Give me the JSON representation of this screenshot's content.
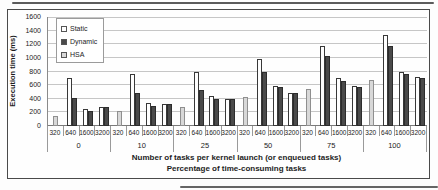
{
  "figure": {
    "y_axis_title": "Execution time (ms)",
    "caption_line1": "Number of tasks per kernel launch (or enqueued tasks)",
    "caption_line2": "Percentage of time-consuming tasks"
  },
  "chart_data": {
    "type": "bar",
    "title": "",
    "ylabel": "Execution time (ms)",
    "xlabel": "Number of tasks per kernel launch (or enqueued tasks)",
    "xlabel2": "Percentage of time-consuming tasks",
    "ylim": [
      0,
      1600
    ],
    "yticks": [
      0,
      200,
      400,
      600,
      800,
      1000,
      1200,
      1400,
      1600
    ],
    "grid": true,
    "legend_position": "upper-left-inside",
    "legend": [
      "Static",
      "Dynamic",
      "HSA"
    ],
    "series_colors": {
      "Static": "#fefefe",
      "Dynamic": "#4a4a4a",
      "HSA": "#d8d8d8"
    },
    "categories": [
      "0",
      "10",
      "25",
      "50",
      "75",
      "100"
    ],
    "slots": [
      "320",
      "640",
      "1600",
      "3200"
    ],
    "groups": [
      {
        "category": "0",
        "bars": [
          {
            "slot": "320",
            "series": "HSA",
            "value": 150
          },
          {
            "slot": "640",
            "series": "Static",
            "value": 700
          },
          {
            "slot": "640",
            "series": "Dynamic",
            "value": 410
          },
          {
            "slot": "1600",
            "series": "Static",
            "value": 250
          },
          {
            "slot": "1600",
            "series": "Dynamic",
            "value": 220
          },
          {
            "slot": "3200",
            "series": "Static",
            "value": 280
          },
          {
            "slot": "3200",
            "series": "Dynamic",
            "value": 280
          }
        ]
      },
      {
        "category": "10",
        "bars": [
          {
            "slot": "320",
            "series": "HSA",
            "value": 225
          },
          {
            "slot": "640",
            "series": "Static",
            "value": 760
          },
          {
            "slot": "640",
            "series": "Dynamic",
            "value": 490
          },
          {
            "slot": "1600",
            "series": "Static",
            "value": 340
          },
          {
            "slot": "1600",
            "series": "Dynamic",
            "value": 300
          },
          {
            "slot": "3200",
            "series": "Static",
            "value": 330
          },
          {
            "slot": "3200",
            "series": "Dynamic",
            "value": 330
          }
        ]
      },
      {
        "category": "25",
        "bars": [
          {
            "slot": "320",
            "series": "HSA",
            "value": 280
          },
          {
            "slot": "640",
            "series": "Static",
            "value": 800
          },
          {
            "slot": "640",
            "series": "Dynamic",
            "value": 530
          },
          {
            "slot": "1600",
            "series": "Static",
            "value": 440
          },
          {
            "slot": "1600",
            "series": "Dynamic",
            "value": 400
          },
          {
            "slot": "3200",
            "series": "Static",
            "value": 390
          },
          {
            "slot": "3200",
            "series": "Dynamic",
            "value": 390
          }
        ]
      },
      {
        "category": "50",
        "bars": [
          {
            "slot": "320",
            "series": "HSA",
            "value": 420
          },
          {
            "slot": "640",
            "series": "Static",
            "value": 990
          },
          {
            "slot": "640",
            "series": "Dynamic",
            "value": 790
          },
          {
            "slot": "1600",
            "series": "Static",
            "value": 590
          },
          {
            "slot": "1600",
            "series": "Dynamic",
            "value": 570
          },
          {
            "slot": "3200",
            "series": "Static",
            "value": 490
          },
          {
            "slot": "3200",
            "series": "Dynamic",
            "value": 490
          }
        ]
      },
      {
        "category": "75",
        "bars": [
          {
            "slot": "320",
            "series": "HSA",
            "value": 540
          },
          {
            "slot": "640",
            "series": "Static",
            "value": 1180
          },
          {
            "slot": "640",
            "series": "Dynamic",
            "value": 1030
          },
          {
            "slot": "1600",
            "series": "Static",
            "value": 700
          },
          {
            "slot": "1600",
            "series": "Dynamic",
            "value": 660
          },
          {
            "slot": "3200",
            "series": "Static",
            "value": 590
          },
          {
            "slot": "3200",
            "series": "Dynamic",
            "value": 580
          }
        ]
      },
      {
        "category": "100",
        "bars": [
          {
            "slot": "320",
            "series": "HSA",
            "value": 680
          },
          {
            "slot": "640",
            "series": "Static",
            "value": 1340
          },
          {
            "slot": "640",
            "series": "Dynamic",
            "value": 1170
          },
          {
            "slot": "1600",
            "series": "Static",
            "value": 790
          },
          {
            "slot": "1600",
            "series": "Dynamic",
            "value": 770
          },
          {
            "slot": "3200",
            "series": "Static",
            "value": 720
          },
          {
            "slot": "3200",
            "series": "Dynamic",
            "value": 700
          }
        ]
      }
    ]
  }
}
